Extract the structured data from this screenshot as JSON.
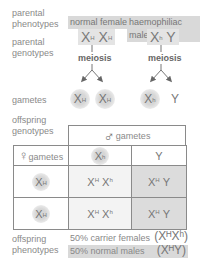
{
  "labels": {
    "parental_phenotypes": [
      "parental",
      "phenotypes"
    ],
    "parental_genotypes": [
      "parental",
      "genotypes"
    ],
    "gametes": "gametes",
    "offspring_genotypes": [
      "offspring",
      "genotypes"
    ],
    "offspring_phenotypes": [
      "offspring",
      "phenotypes"
    ]
  },
  "parents": {
    "female": {
      "phenotype": "normal female",
      "genotype": [
        {
          "base": "X",
          "sup": "H"
        },
        {
          "base": "X",
          "sup": "H"
        }
      ],
      "process": "meiosis",
      "gametes": [
        {
          "base": "X",
          "sup": "H"
        },
        {
          "base": "X",
          "sup": "H"
        }
      ]
    },
    "male": {
      "phenotype": "haemophiliac male",
      "genotype": [
        {
          "base": "X",
          "sup": "h"
        },
        {
          "base": "Y",
          "sup": ""
        }
      ],
      "process": "meiosis",
      "gametes": [
        {
          "base": "X",
          "sup": "h"
        },
        {
          "base": "Y",
          "sup": ""
        }
      ]
    }
  },
  "punnett": {
    "male_header": "gametes",
    "male_symbol": "♂",
    "female_header": "gametes",
    "female_symbol": "♀",
    "col_headers": [
      {
        "base": "X",
        "sup": "h"
      },
      {
        "base": "Y",
        "sup": ""
      }
    ],
    "rows": [
      {
        "header": {
          "base": "X",
          "sup": "H"
        },
        "cells": [
          {
            "parts": [
              {
                "base": "X",
                "sup": "H"
              },
              {
                "base": "X",
                "sup": "h"
              }
            ],
            "shaded": false
          },
          {
            "parts": [
              {
                "base": "X",
                "sup": "H"
              },
              {
                "base": "Y",
                "sup": ""
              }
            ],
            "shaded": true
          }
        ]
      },
      {
        "header": {
          "base": "X",
          "sup": "H"
        },
        "cells": [
          {
            "parts": [
              {
                "base": "X",
                "sup": "H"
              },
              {
                "base": "X",
                "sup": "h"
              }
            ],
            "shaded": false
          },
          {
            "parts": [
              {
                "base": "X",
                "sup": "H"
              },
              {
                "base": "Y",
                "sup": ""
              }
            ],
            "shaded": true
          }
        ]
      }
    ]
  },
  "results": [
    {
      "text": "50% carrier females",
      "genotype": "(XᴴXʰ)",
      "shaded": false
    },
    {
      "text": "50% normal males",
      "genotype": "(XᴴY)",
      "shaded": true
    }
  ],
  "colors": {
    "text": "#8a8a8a",
    "box_fill": "#d9d9d9",
    "shaded_cell": "#dcdcdc",
    "border": "#8a8a8a"
  }
}
